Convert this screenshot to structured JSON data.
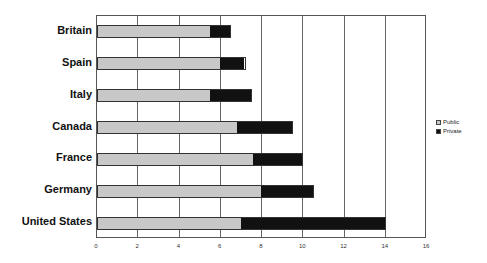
{
  "chart_data": {
    "type": "bar",
    "orientation": "horizontal",
    "stacked": true,
    "title": "",
    "xlabel": "",
    "ylabel": "",
    "xlim": [
      0,
      16
    ],
    "x_ticks": [
      "0",
      "2",
      "4",
      "6",
      "8",
      "10",
      "12",
      "14",
      "16"
    ],
    "grid": true,
    "legend_position": "right",
    "categories": [
      "Britain",
      "Spain",
      "Italy",
      "Canada",
      "France",
      "Germany",
      "United States"
    ],
    "series": [
      {
        "name": "Public",
        "color": "#c8c8c8",
        "values": [
          5.5,
          6.0,
          5.5,
          6.8,
          7.6,
          8.0,
          7.0
        ]
      },
      {
        "name": "Private",
        "color": "#111111",
        "values": [
          1.0,
          1.2,
          2.0,
          2.7,
          2.4,
          2.5,
          7.0
        ]
      }
    ]
  }
}
